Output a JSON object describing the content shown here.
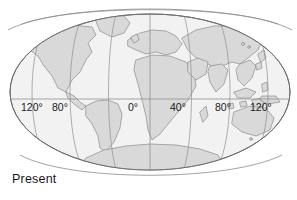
{
  "figure": {
    "caption": "Present",
    "projection_shape": "ellipse",
    "colors": {
      "background": "#ffffff",
      "ocean": "#f2f2f2",
      "land": "#d9d9d9",
      "coastline": "#8a8a8a",
      "graticule": "#8f8f8f",
      "outline": "#6f6f6f",
      "text": "#171717"
    }
  },
  "map": {
    "graticule": {
      "equator_label_row": [
        {
          "label": "120°",
          "x": 21,
          "longitude": -120
        },
        {
          "label": "80°",
          "x": 52,
          "longitude": -80
        },
        {
          "label": "0°",
          "x": 128,
          "longitude": 0
        },
        {
          "label": "40°",
          "x": 170,
          "longitude": 40
        },
        {
          "label": "80°",
          "x": 215,
          "longitude": 80
        },
        {
          "label": "120°",
          "x": 250,
          "longitude": 120
        }
      ],
      "equator_y": 99,
      "meridian_longitudes": [
        -120,
        -80,
        -40,
        0,
        40,
        80,
        120
      ],
      "central_meridian": 0
    },
    "landmasses": [
      "north-america",
      "south-america",
      "greenland",
      "europe",
      "africa",
      "asia",
      "india",
      "southeast-asia-islands",
      "australia",
      "antarctica",
      "japan",
      "madagascar",
      "new-zealand"
    ]
  }
}
